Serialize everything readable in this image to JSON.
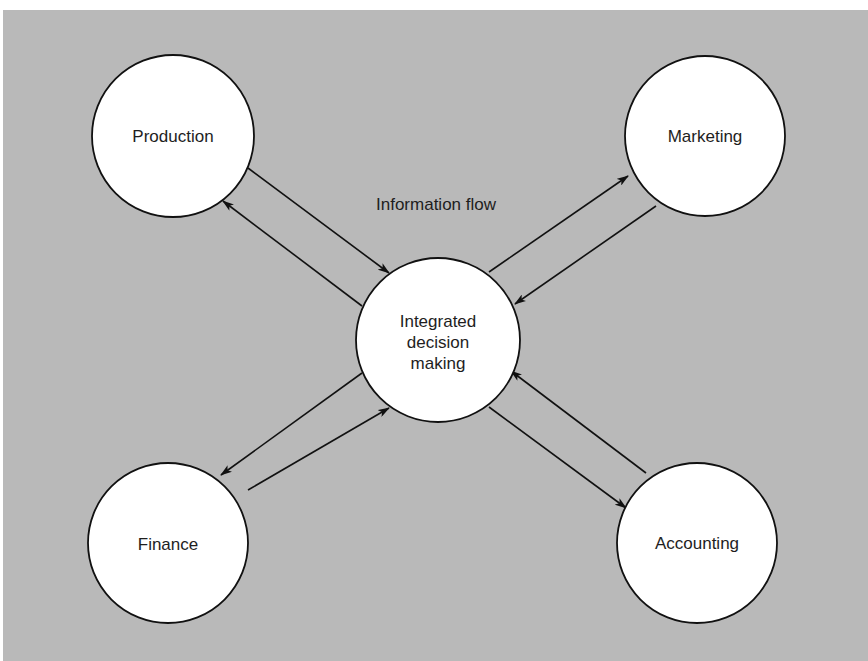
{
  "diagram": {
    "title": "Information flow",
    "background_color": "#b9b9b9",
    "node_fill": "#ffffff",
    "stroke_color": "#111111",
    "nodes": [
      {
        "id": "production",
        "label": "Production",
        "cx": 173,
        "cy": 136,
        "r": 81
      },
      {
        "id": "marketing",
        "label": "Marketing",
        "cx": 705,
        "cy": 136,
        "r": 80
      },
      {
        "id": "center",
        "label_lines": [
          "Integrated",
          "decision",
          "making"
        ],
        "cx": 438,
        "cy": 340,
        "r": 82
      },
      {
        "id": "finance",
        "label": "Finance",
        "cx": 168,
        "cy": 543,
        "r": 80
      },
      {
        "id": "accounting",
        "label": "Accounting",
        "cx": 697,
        "cy": 543,
        "r": 80
      }
    ],
    "edges": [
      {
        "from": "production",
        "to": "center"
      },
      {
        "from": "center",
        "to": "production"
      },
      {
        "from": "center",
        "to": "marketing"
      },
      {
        "from": "marketing",
        "to": "center"
      },
      {
        "from": "center",
        "to": "finance"
      },
      {
        "from": "finance",
        "to": "center"
      },
      {
        "from": "accounting",
        "to": "center"
      },
      {
        "from": "center",
        "to": "accounting"
      }
    ]
  }
}
